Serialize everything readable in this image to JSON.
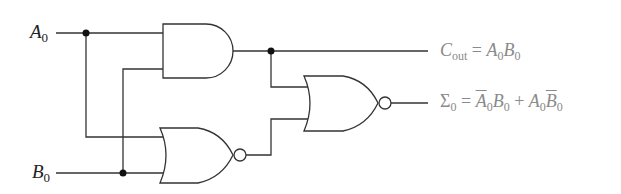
{
  "diagram": {
    "inputs": [
      {
        "id": "A0",
        "name": "A",
        "sub": "0"
      },
      {
        "id": "B0",
        "name": "B",
        "sub": "0"
      }
    ],
    "gates": [
      {
        "id": "and1",
        "type": "AND"
      },
      {
        "id": "nor1",
        "type": "NOR"
      },
      {
        "id": "nor2",
        "type": "NOR"
      }
    ],
    "outputs": [
      {
        "id": "cout",
        "lhs": "C",
        "lhs_sub": "out",
        "eq": "=",
        "rhs": "A0B0"
      },
      {
        "id": "sum",
        "lhs": "Σ",
        "lhs_sub": "0",
        "eq": "=",
        "rhs": "A̅0B0 + A0B̅0"
      }
    ],
    "colors": {
      "line": "#333333",
      "output_text": "#8a8a8a",
      "input_text": "#222222"
    }
  },
  "labels": {
    "a_name": "A",
    "a_sub": "0",
    "b_name": "B",
    "b_sub": "0",
    "cout_c": "C",
    "cout_sub": "out",
    "cout_eq": " = ",
    "cout_a": "A",
    "cout_a_sub": "0",
    "cout_b": "B",
    "cout_b_sub": "0",
    "sum_sigma": "Σ",
    "sum_sub": "0",
    "sum_eq": " = ",
    "t1_a": "A",
    "t1_a_sub": "0",
    "t1_b": "B",
    "t1_b_sub": "0",
    "plus": " + ",
    "t2_a": "A",
    "t2_a_sub": "0",
    "t2_b": "B",
    "t2_b_sub": "0"
  }
}
